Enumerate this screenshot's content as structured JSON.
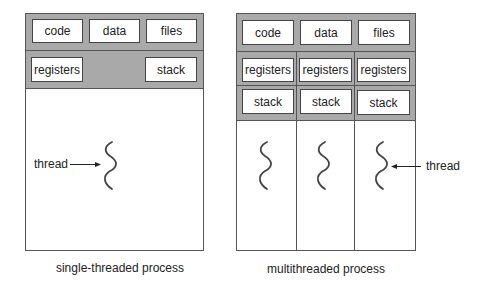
{
  "single": {
    "shared": [
      "code",
      "data",
      "files"
    ],
    "registers": "registers",
    "stack": "stack",
    "thread_label": "thread",
    "caption": "single-threaded process"
  },
  "multi": {
    "shared": [
      "code",
      "data",
      "files"
    ],
    "registers": [
      "registers",
      "registers",
      "registers"
    ],
    "stacks": [
      "stack",
      "stack",
      "stack"
    ],
    "thread_label": "thread",
    "caption": "multithreaded process"
  },
  "colors": {
    "band": "#a9a9a9",
    "border": "#555555",
    "box": "#ffffff"
  }
}
